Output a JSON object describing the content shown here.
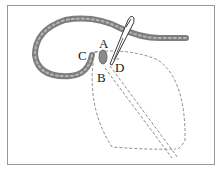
{
  "diagram": {
    "labels": [
      {
        "id": "A",
        "text": "A"
      },
      {
        "id": "B",
        "text": "B"
      },
      {
        "id": "C",
        "text": "C"
      },
      {
        "id": "D",
        "text": "D"
      }
    ],
    "colors": {
      "frame": "#9a9a9a",
      "thread": "#7d7d7d",
      "thread_highlight": "#b5b5b5",
      "dashed_outline": "#8a8a8a",
      "needle": "#3a3a3a",
      "label": "#1a1a1a"
    }
  }
}
